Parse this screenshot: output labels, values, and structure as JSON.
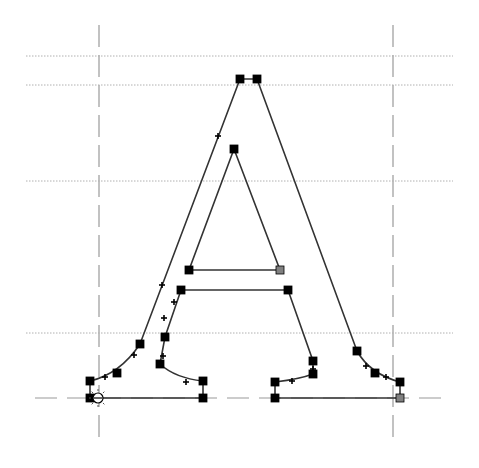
{
  "editor": {
    "type": "glyph-outline-editor",
    "glyph": "A",
    "background": "#ffffff",
    "outline_color": "#333333",
    "node_color": "#000000",
    "guide_color": "#9a9a9a",
    "selected_node_color": "#808080"
  },
  "guides": {
    "vertical": [
      {
        "name": "left-sidebearing",
        "x": 99,
        "y1": 25,
        "y2": 445
      },
      {
        "name": "right-sidebearing",
        "x": 393,
        "y1": 25,
        "y2": 445
      }
    ],
    "horizontal_dotted": [
      {
        "name": "ascender-line",
        "y": 56,
        "x1": 26,
        "x2": 453
      },
      {
        "name": "cap-height-line",
        "y": 85,
        "x1": 26,
        "x2": 453
      },
      {
        "name": "x-height-line",
        "y": 181,
        "x1": 26,
        "x2": 453
      },
      {
        "name": "serif-line",
        "y": 333,
        "x1": 26,
        "x2": 453
      }
    ],
    "baseline": {
      "y": 398,
      "x1": 35,
      "x2": 442
    }
  },
  "outer_contour": {
    "nodes": [
      [
        240,
        79
      ],
      [
        257,
        79
      ],
      [
        357,
        351
      ],
      [
        375,
        373
      ],
      [
        400,
        382
      ],
      [
        400,
        398
      ],
      [
        275,
        398
      ],
      [
        275,
        382
      ],
      [
        313,
        374
      ],
      [
        313,
        361
      ],
      [
        288,
        290
      ],
      [
        181,
        290
      ],
      [
        165,
        337
      ],
      [
        160,
        364
      ],
      [
        203,
        381
      ],
      [
        203,
        398
      ],
      [
        90,
        398
      ],
      [
        90,
        381
      ],
      [
        117,
        373
      ],
      [
        140,
        344
      ]
    ],
    "control_points": [
      [
        218,
        136
      ],
      [
        162,
        285
      ],
      [
        134,
        355
      ],
      [
        105,
        377
      ],
      [
        366,
        366
      ],
      [
        386,
        377
      ],
      [
        292,
        381
      ],
      [
        313,
        369
      ],
      [
        174,
        302
      ],
      [
        164,
        318
      ],
      [
        163,
        356
      ],
      [
        186,
        382
      ]
    ]
  },
  "inner_contour": {
    "nodes": [
      [
        234,
        149
      ],
      [
        280,
        270
      ],
      [
        189,
        270
      ]
    ]
  },
  "start_point": {
    "x": 98,
    "y": 398
  }
}
